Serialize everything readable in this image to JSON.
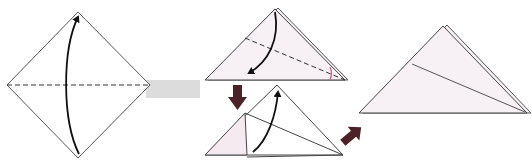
{
  "diagram": {
    "colors": {
      "paper_front": "#ffffff",
      "paper_back": "#f7f0f4",
      "outline": "#555555",
      "arrow": "#111111",
      "step_arrow": "#4a2228",
      "angle_mark": "#c0607a",
      "band": "#dcdcdc"
    },
    "steps": [
      {
        "id": 1,
        "shape": "square-diamond",
        "fold": "valley fold along horizontal diagonal",
        "arrow": "bottom-to-top"
      },
      {
        "id": 2,
        "shape": "triangle",
        "fold": "valley fold along dashed line, bisecting angle",
        "arrow": "apex-down-left"
      },
      {
        "id": 3,
        "shape": "triangle with folded flap",
        "fold": "unfold / fold flap back up",
        "arrow": "bottom-to-top"
      },
      {
        "id": 4,
        "shape": "triangle with crease",
        "fold": "result"
      }
    ],
    "transition_arrows": [
      {
        "from": 2,
        "to": 3,
        "direction": "down"
      },
      {
        "from": 3,
        "to": 4,
        "direction": "up-right"
      }
    ]
  }
}
